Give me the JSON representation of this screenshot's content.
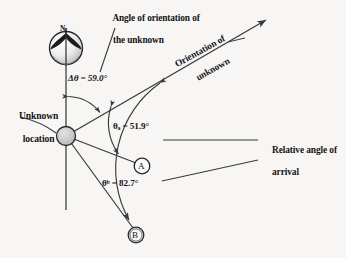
{
  "diagram": {
    "background_color": "#f7f6f4",
    "line_color": "#3a3a3a",
    "node_fill": "#c9c9c9"
  },
  "labels": {
    "title_line1": "Angle of orientation of",
    "title_line2": "the unknown",
    "delta_theta": "Δθ = 59.0°",
    "unknown_location_line1": "Unknown",
    "unknown_location_line2": "location",
    "theta_a": "θₐ = 51.9°",
    "theta_b": "θᵇ = 82.7°",
    "orientation_line1": "Orientation of",
    "orientation_line2": "unknown",
    "relative_line1": "Relative angle of",
    "relative_line2": "arrival",
    "north": "N",
    "node_a": "A",
    "node_b": "B"
  },
  "values": {
    "delta_theta_deg": 59.0,
    "theta_a_deg": 51.9,
    "theta_b_deg": 82.7
  },
  "nodes": [
    {
      "id": "unknown",
      "label": "",
      "x": 66,
      "y": 136,
      "r": 10
    },
    {
      "id": "A",
      "label": "A",
      "x": 142,
      "y": 166,
      "r": 8
    },
    {
      "id": "B",
      "label": "B",
      "x": 136,
      "y": 235,
      "r": 8
    }
  ],
  "icons": {
    "compass": "compass-rose-icon",
    "arrow": "arrow-icon"
  }
}
